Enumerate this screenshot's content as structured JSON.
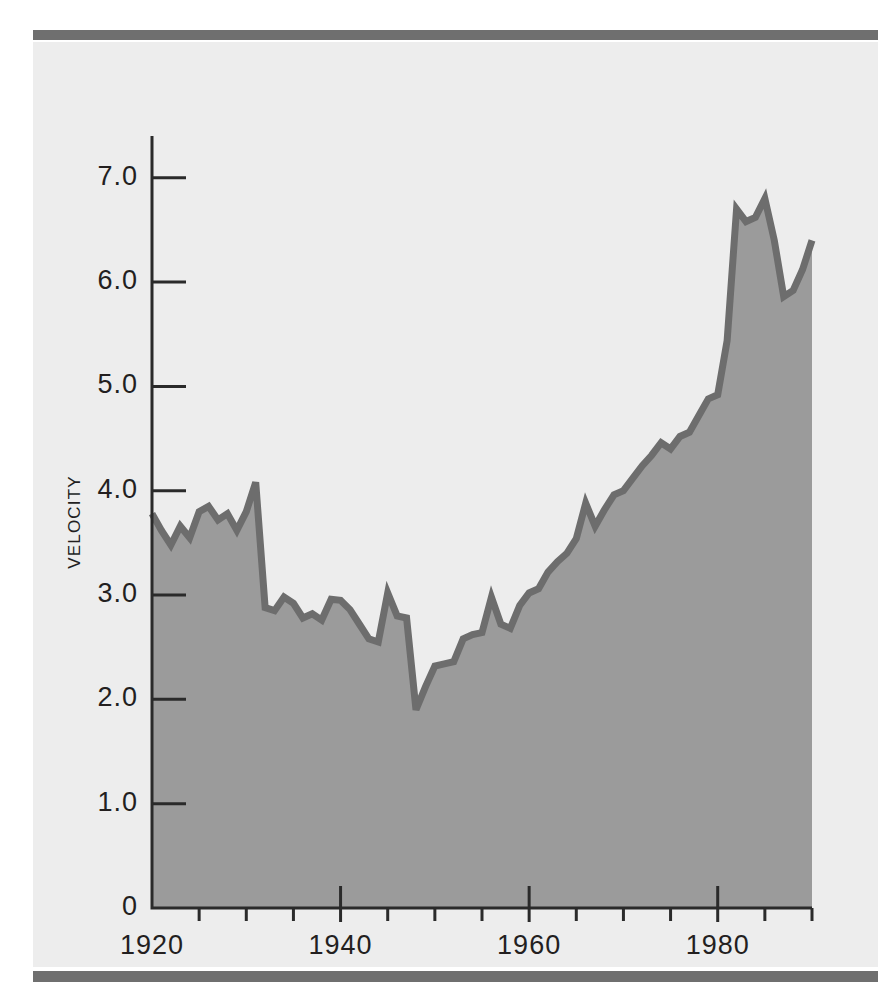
{
  "figure": {
    "background_color": "#ededed",
    "page_color": "#ffffff",
    "rule_color": "#6f6f6f",
    "fill_color": "#9b9b9b",
    "line_color": "#6d6d6d",
    "axis_color": "#2a2a2a"
  },
  "axis": {
    "y_title": "VELOCITY",
    "y_ticks": [
      "0",
      "1.0",
      "2.0",
      "3.0",
      "4.0",
      "5.0",
      "6.0",
      "7.0"
    ],
    "x_ticks": [
      "1920",
      "1940",
      "1960",
      "1980"
    ]
  },
  "chart_data": {
    "type": "area",
    "title": "",
    "subtitle": "",
    "xlabel": "",
    "ylabel": "VELOCITY",
    "xlim": [
      1920,
      1990
    ],
    "ylim": [
      0,
      7.4
    ],
    "yticks": [
      0,
      1.0,
      2.0,
      3.0,
      4.0,
      5.0,
      6.0,
      7.0
    ],
    "ytick_labels": [
      "0",
      "1.0",
      "2.0",
      "3.0",
      "4.0",
      "5.0",
      "6.0",
      "7.0"
    ],
    "xticks": [
      1920,
      1940,
      1960,
      1980
    ],
    "xtick_labels": [
      "1920",
      "1940",
      "1960",
      "1980"
    ],
    "xminor_ticks": [
      1925,
      1930,
      1935,
      1945,
      1950,
      1955,
      1965,
      1970,
      1975,
      1985,
      1990
    ],
    "grid": false,
    "legend": null,
    "annotations": [],
    "series": [
      {
        "name": "Velocity",
        "fill": true,
        "x": [
          1920,
          1921,
          1922,
          1923,
          1924,
          1925,
          1926,
          1927,
          1928,
          1929,
          1930,
          1931,
          1932,
          1933,
          1934,
          1935,
          1936,
          1937,
          1938,
          1939,
          1940,
          1941,
          1942,
          1943,
          1944,
          1945,
          1946,
          1947,
          1948,
          1949,
          1950,
          1951,
          1952,
          1953,
          1954,
          1955,
          1956,
          1957,
          1958,
          1959,
          1960,
          1961,
          1962,
          1963,
          1964,
          1965,
          1966,
          1967,
          1968,
          1969,
          1970,
          1971,
          1972,
          1973,
          1974,
          1975,
          1976,
          1977,
          1978,
          1979,
          1980,
          1981,
          1982,
          1983,
          1984,
          1985,
          1986,
          1987,
          1988,
          1989,
          1990
        ],
        "values": [
          3.78,
          3.62,
          3.48,
          3.66,
          3.55,
          3.8,
          3.85,
          3.72,
          3.78,
          3.62,
          3.8,
          4.08,
          2.88,
          2.85,
          2.98,
          2.92,
          2.78,
          2.82,
          2.76,
          2.96,
          2.95,
          2.86,
          2.72,
          2.58,
          2.55,
          3.02,
          2.8,
          2.78,
          1.9,
          2.12,
          2.32,
          2.34,
          2.36,
          2.58,
          2.62,
          2.64,
          2.98,
          2.72,
          2.68,
          2.9,
          3.02,
          3.06,
          3.22,
          3.32,
          3.4,
          3.54,
          3.88,
          3.66,
          3.82,
          3.96,
          4.0,
          4.12,
          4.24,
          4.34,
          4.46,
          4.4,
          4.52,
          4.56,
          4.72,
          4.88,
          4.92,
          5.44,
          6.7,
          6.58,
          6.62,
          6.8,
          6.4,
          5.86,
          5.92,
          6.12,
          6.4
        ]
      }
    ]
  }
}
